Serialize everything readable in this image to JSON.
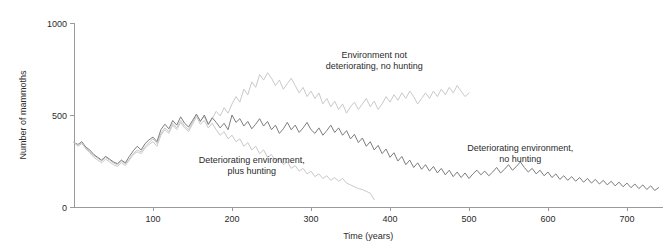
{
  "chart_data": {
    "type": "line",
    "title": "",
    "xlabel": "Time (years)",
    "ylabel": "Number of mammoths",
    "xlim": [
      0,
      745
    ],
    "ylim": [
      0,
      1000
    ],
    "xticks": [
      100,
      200,
      300,
      400,
      500,
      600,
      700
    ],
    "yticks": [
      0,
      500,
      1000
    ],
    "grid": false,
    "legend": "annotations-inline",
    "annotations": [
      {
        "id": "annot-no-deterioration",
        "text_lines": [
          "Environment not",
          "deteriorating, no hunting"
        ],
        "x": 380,
        "y": 810,
        "series": "environment_not_deteriorating_no_hunting"
      },
      {
        "id": "annot-deteriorating-plus-hunting",
        "text_lines": [
          "Deteriorating environment,",
          "plus hunting"
        ],
        "x": 225,
        "y": 240,
        "series": "deteriorating_environment_plus_hunting"
      },
      {
        "id": "annot-deteriorating-no-hunting",
        "text_lines": [
          "Deteriorating environment,",
          "no hunting"
        ],
        "x": 565,
        "y": 305,
        "series": "deteriorating_environment_no_hunting"
      }
    ],
    "series": [
      {
        "name": "Environment not deteriorating, no hunting",
        "key": "environment_not_deteriorating_no_hunting",
        "color": "#c9c9c9",
        "x": [
          0,
          5,
          10,
          15,
          20,
          25,
          30,
          35,
          40,
          45,
          50,
          55,
          60,
          65,
          70,
          75,
          80,
          85,
          90,
          95,
          100,
          105,
          110,
          115,
          120,
          125,
          130,
          135,
          140,
          145,
          150,
          155,
          160,
          165,
          170,
          175,
          180,
          185,
          190,
          195,
          200,
          205,
          210,
          215,
          220,
          225,
          230,
          235,
          240,
          245,
          250,
          255,
          260,
          265,
          270,
          275,
          280,
          285,
          290,
          295,
          300,
          305,
          310,
          315,
          320,
          325,
          330,
          335,
          340,
          345,
          350,
          355,
          360,
          365,
          370,
          375,
          380,
          385,
          390,
          395,
          400,
          405,
          410,
          415,
          420,
          425,
          430,
          435,
          440,
          445,
          450,
          455,
          460,
          465,
          470,
          475,
          480,
          485,
          490,
          495,
          500
        ],
        "values": [
          350,
          330,
          345,
          320,
          300,
          280,
          265,
          250,
          270,
          255,
          240,
          230,
          250,
          235,
          260,
          290,
          310,
          300,
          330,
          350,
          370,
          345,
          400,
          430,
          410,
          455,
          430,
          470,
          440,
          420,
          460,
          500,
          470,
          490,
          445,
          480,
          520,
          495,
          540,
          510,
          560,
          600,
          570,
          640,
          610,
          680,
          650,
          720,
          690,
          730,
          700,
          660,
          690,
          640,
          670,
          700,
          660,
          620,
          650,
          600,
          630,
          590,
          620,
          560,
          590,
          545,
          575,
          530,
          560,
          510,
          545,
          570,
          530,
          560,
          590,
          545,
          575,
          530,
          560,
          600,
          570,
          610,
          580,
          620,
          590,
          630,
          600,
          560,
          590,
          620,
          590,
          630,
          600,
          640,
          610,
          650,
          620,
          660,
          630,
          600,
          620
        ]
      },
      {
        "name": "Deteriorating environment, no hunting",
        "key": "deteriorating_environment_no_hunting",
        "color": "#7d7d7d",
        "x": [
          0,
          5,
          10,
          15,
          20,
          25,
          30,
          35,
          40,
          45,
          50,
          55,
          60,
          65,
          70,
          75,
          80,
          85,
          90,
          95,
          100,
          105,
          110,
          115,
          120,
          125,
          130,
          135,
          140,
          145,
          150,
          155,
          160,
          165,
          170,
          175,
          180,
          185,
          190,
          195,
          200,
          205,
          210,
          215,
          220,
          225,
          230,
          235,
          240,
          245,
          250,
          255,
          260,
          265,
          270,
          275,
          280,
          285,
          290,
          295,
          300,
          305,
          310,
          315,
          320,
          325,
          330,
          335,
          340,
          345,
          350,
          355,
          360,
          365,
          370,
          375,
          380,
          385,
          390,
          395,
          400,
          405,
          410,
          415,
          420,
          425,
          430,
          435,
          440,
          445,
          450,
          455,
          460,
          465,
          470,
          475,
          480,
          485,
          490,
          495,
          500,
          505,
          510,
          515,
          520,
          525,
          530,
          535,
          540,
          545,
          550,
          555,
          560,
          565,
          570,
          575,
          580,
          585,
          590,
          595,
          600,
          605,
          610,
          615,
          620,
          625,
          630,
          635,
          640,
          645,
          650,
          655,
          660,
          665,
          670,
          675,
          680,
          685,
          690,
          695,
          700,
          705,
          710,
          715,
          720,
          725,
          730,
          735,
          740
        ],
        "values": [
          350,
          340,
          355,
          325,
          310,
          285,
          270,
          255,
          275,
          260,
          245,
          235,
          255,
          240,
          275,
          305,
          330,
          310,
          345,
          365,
          380,
          355,
          420,
          450,
          425,
          470,
          445,
          490,
          455,
          435,
          470,
          505,
          465,
          500,
          450,
          485,
          460,
          430,
          455,
          420,
          500,
          460,
          480,
          440,
          465,
          425,
          450,
          480,
          440,
          465,
          420,
          445,
          400,
          425,
          460,
          420,
          445,
          405,
          430,
          460,
          420,
          400,
          430,
          390,
          415,
          445,
          405,
          430,
          390,
          415,
          370,
          395,
          350,
          375,
          330,
          355,
          310,
          335,
          290,
          315,
          270,
          295,
          250,
          275,
          230,
          255,
          215,
          240,
          205,
          230,
          195,
          220,
          185,
          210,
          175,
          200,
          165,
          190,
          160,
          185,
          155,
          180,
          200,
          175,
          195,
          170,
          190,
          215,
          185,
          205,
          230,
          200,
          220,
          245,
          215,
          190,
          210,
          180,
          200,
          170,
          190,
          160,
          180,
          150,
          170,
          145,
          165,
          140,
          160,
          135,
          155,
          130,
          150,
          125,
          145,
          120,
          140,
          115,
          135,
          110,
          130,
          105,
          125,
          100,
          120,
          95,
          115,
          90,
          105
        ]
      },
      {
        "name": "Deteriorating environment, plus hunting",
        "key": "deteriorating_environment_plus_hunting",
        "color": "#c9c9c9",
        "x": [
          0,
          5,
          10,
          15,
          20,
          25,
          30,
          35,
          40,
          45,
          50,
          55,
          60,
          65,
          70,
          75,
          80,
          85,
          90,
          95,
          100,
          105,
          110,
          115,
          120,
          125,
          130,
          135,
          140,
          145,
          150,
          155,
          160,
          165,
          170,
          175,
          180,
          185,
          190,
          195,
          200,
          205,
          210,
          215,
          220,
          225,
          230,
          235,
          240,
          245,
          250,
          255,
          260,
          265,
          270,
          275,
          280,
          285,
          290,
          295,
          300,
          305,
          310,
          315,
          320,
          325,
          330,
          335,
          340,
          345,
          350,
          355,
          360,
          365,
          370,
          375,
          380
        ],
        "values": [
          350,
          335,
          350,
          315,
          295,
          270,
          255,
          240,
          260,
          245,
          230,
          220,
          240,
          225,
          255,
          285,
          300,
          290,
          320,
          340,
          355,
          330,
          390,
          420,
          400,
          445,
          420,
          460,
          430,
          410,
          450,
          490,
          450,
          470,
          430,
          455,
          420,
          390,
          410,
          370,
          390,
          355,
          370,
          330,
          350,
          310,
          330,
          290,
          310,
          270,
          285,
          250,
          265,
          230,
          245,
          210,
          225,
          195,
          210,
          180,
          195,
          165,
          180,
          155,
          170,
          145,
          160,
          140,
          155,
          130,
          120,
          110,
          100,
          95,
          85,
          75,
          40
        ]
      }
    ]
  }
}
